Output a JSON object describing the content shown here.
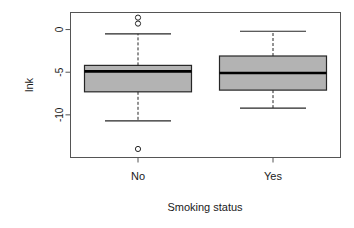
{
  "chart_data": {
    "type": "box",
    "title": "",
    "xlabel": "Smoking status",
    "ylabel": "lnk",
    "categories": [
      "No",
      "Yes"
    ],
    "ytick_labels": [
      "0",
      "-5",
      "-10"
    ],
    "ytick_values": [
      0,
      -5,
      -10
    ],
    "ylim": [
      -15.0,
      2.0
    ],
    "grid": false,
    "legend": "none",
    "box_fill_color": "#b3b3b3",
    "box_line_color": "#262626",
    "frame": true,
    "series": [
      {
        "name": "No",
        "min_whisker": -10.7,
        "q1": -7.3,
        "median": -4.9,
        "q3": -4.2,
        "max_whisker": -0.5,
        "outliers": [
          1.4,
          0.7,
          -14.0
        ]
      },
      {
        "name": "Yes",
        "min_whisker": -9.2,
        "q1": -7.1,
        "median": -5.1,
        "q3": -3.1,
        "max_whisker": -0.2,
        "outliers": []
      }
    ]
  },
  "axes": {
    "y_axis_label": "lnk",
    "x_axis_label": "Smoking status",
    "y_ticks": [
      {
        "label": "0",
        "value": 0
      },
      {
        "label": "-5",
        "value": -5
      },
      {
        "label": "-10",
        "value": -10
      }
    ],
    "x_ticks": [
      {
        "label": "No"
      },
      {
        "label": "Yes"
      }
    ]
  }
}
